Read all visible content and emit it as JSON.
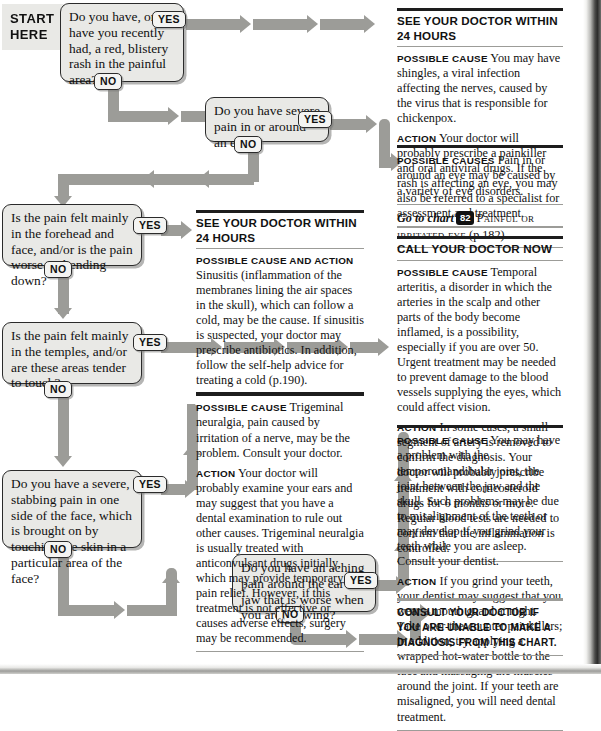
{
  "chart": {
    "start_label_line1": "START",
    "start_label_line2": "HERE",
    "yes": "YES",
    "no": "NO"
  },
  "questions": [
    {
      "id": "q1",
      "text": "Do you have, or have you recently had, a red, blistery rash in the painful area?"
    },
    {
      "id": "q2",
      "text": "Do you have severe pain in or around an eye?"
    },
    {
      "id": "q3",
      "text": "Is the pain felt mainly in the forehead and face, and/or is the pain worse on bending down?"
    },
    {
      "id": "q4",
      "text": "Is the pain felt mainly in the temples, and/or are these areas tender to touch?"
    },
    {
      "id": "q5",
      "text": "Do you have a severe, stabbing pain in one side of the face, which is brought on by touching the skin in a particular area of the face?"
    },
    {
      "id": "q6",
      "text": "Do you have an aching pain around the ear or jaw that is worse when you are chewing?"
    }
  ],
  "panels": {
    "shingles": {
      "title": "SEE YOUR DOCTOR WITHIN 24 HOURS",
      "cause_lead": "Possible cause",
      "cause_text": "You may have shingles, a viral infection affecting the nerves, caused by the virus that is responsible for chickenpox.",
      "action_lead": "Action",
      "action_text": "Your doctor will probably prescribe a painkiller and oral antiviral drugs. If the rash is affecting an eye, you may also be referred to a specialist for assessment and treatment."
    },
    "eye": {
      "cause_lead": "Possible causes",
      "cause_text": "Pain in or around an eye may be caused by a variety of eye disorders.",
      "goto_prefix": "Go to chart",
      "goto_number": "82",
      "goto_title": "Painful or irritated eye",
      "goto_page": "(p.182)."
    },
    "sinusitis": {
      "title_line1": "SEE YOUR DOCTOR WITHIN",
      "title_line2": "24 HOURS",
      "cause_lead": "Possible cause and action",
      "cause_text": "Sinusitis (inflammation of the membranes lining the air spaces in the skull), which can follow a cold, may be the cause. If sinusitis is suspected, your doctor may prescribe antibiotics. In addition, follow the self-help advice for treating a cold (p.190)."
    },
    "temporal": {
      "title": "CALL YOUR DOCTOR NOW",
      "cause_lead": "Possible cause",
      "cause_text": "Temporal arteritis, a disorder in which the arteries in the scalp and other parts of the body become inflamed, is a possibility, especially if you are over 50. Urgent treatment may be needed to prevent damage to the blood vessels supplying the eyes, which could affect vision.",
      "action_lead": "Action",
      "action_text": "In some cases, a small segment of artery is removed to confirm the diagnosis. Your doctor will probably prescribe treatment with corticosteroid drugs for 6 months or more. Regular blood tests are needed to confirm that the inflammation is controlled."
    },
    "trigeminal": {
      "cause_lead": "Possible cause",
      "cause_text": "Trigeminal neuralgia, pain caused by irritation of a nerve, may be the problem. Consult your doctor.",
      "action_lead": "Action",
      "action_text": "Your doctor will probably examine your ears and may suggest that you have a dental examination to rule out other causes. Trigeminal neuralgia is usually treated with anticonvulsant drugs initially, which may provide temporary pain relief. However, if this treatment is not effective or causes adverse effects, surgery may be recommended."
    },
    "tmj": {
      "cause_lead": "Possible cause",
      "cause_text": "You may have a problem with the temporomandibular joint, the joint between the jaw and the skull. Such problems may be due to misalignment of the teeth or may develop if you grind your teeth while you are asleep. Consult your dentist.",
      "action_lead": "Action",
      "action_text": "If you grind your teeth, your dentist may suggest that you wear a mouth guard at night. Take over-the-counter painkillers; in addition, try applying a wrapped hot-water bottle to the face and massaging the muscles around the joint. If your teeth are misaligned, you will need dental treatment."
    },
    "consult": {
      "text": "Consult your doctor if you are unable to make a diagnosis from this chart."
    }
  },
  "colors": {
    "arrow": "#9c9c98",
    "box_fill": "#e9e9e6",
    "rule_dark": "#1d1d1d"
  }
}
